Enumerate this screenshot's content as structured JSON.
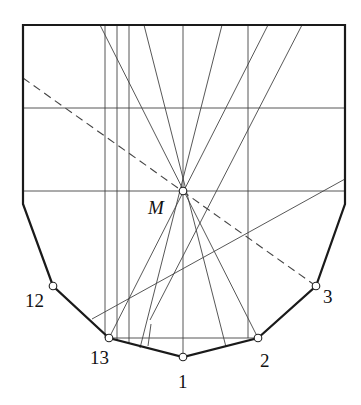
{
  "diagram": {
    "title": "",
    "labels": {
      "M": "M",
      "p1": "1",
      "p2": "2",
      "p3": "3",
      "p12": "12",
      "p13": "13"
    },
    "points": {
      "M": [
        183,
        191
      ],
      "p1": [
        183,
        357
      ],
      "p2": [
        258,
        338
      ],
      "p3": [
        316,
        286
      ],
      "p12": [
        53,
        286
      ],
      "p13": [
        109,
        338
      ]
    },
    "frame": {
      "top": 25,
      "left": 23,
      "right": 345,
      "side_bottom": 204
    },
    "colors": {
      "line": "#444444",
      "outline": "#1a1a1a",
      "point_fill": "#ffffff"
    }
  }
}
